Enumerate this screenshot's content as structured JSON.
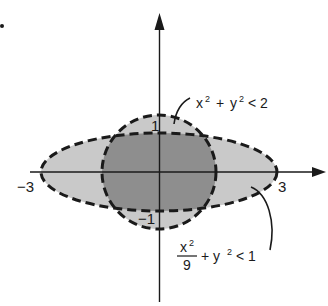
{
  "figure": {
    "marker": ".",
    "axes": {
      "origin_px": [
        159,
        172
      ],
      "unit_px": 39.5,
      "x_axis": {
        "from_px": 30,
        "to_px": 326,
        "arrow": "right"
      },
      "y_axis": {
        "from_px": 302,
        "to_px": 14,
        "arrow": "up"
      }
    },
    "tick_labels": {
      "neg_x": "−3",
      "pos_x": "3",
      "pos_y": "1",
      "neg_y": "−1"
    },
    "regions": [
      {
        "name": "ellipse",
        "equation": "x²/9 + y² < 1",
        "label": {
          "numerator": "x",
          "numerator_exp": "2",
          "denominator": "9",
          "rest": "+ y",
          "rest_exp": "2",
          "relation": "< 1"
        },
        "semi_axes": [
          3,
          1
        ],
        "fill": "#c8c8c8",
        "border": "dashed"
      },
      {
        "name": "circle",
        "equation": "x² + y² < 2",
        "label": {
          "x": "x",
          "x_exp": "2",
          "plus": "+",
          "y": "y",
          "y_exp": "2",
          "relation": "< 2"
        },
        "radius": 1.414,
        "fill": "#c8c8c8",
        "border": "dashed"
      }
    ],
    "colors": {
      "background": "#ffffff",
      "single_region": "#c9c9c9",
      "overlap_region": "#8e8e8e",
      "stroke": "#1a1a1a"
    }
  }
}
